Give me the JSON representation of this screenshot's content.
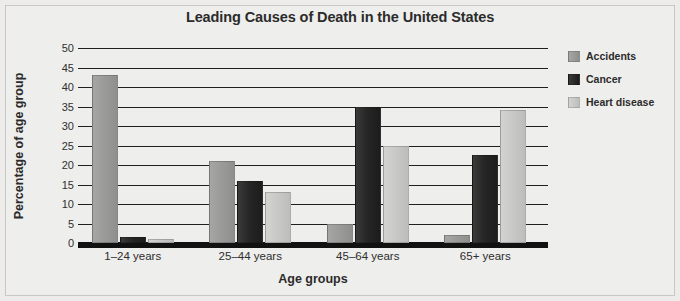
{
  "chart_data": {
    "type": "bar",
    "title": "Leading Causes of Death in the United States",
    "xlabel": "Age groups",
    "ylabel": "Percentage of age group",
    "categories": [
      "1–24 years",
      "25–44 years",
      "45–64 years",
      "65+ years"
    ],
    "series": [
      {
        "name": "Accidents",
        "color": "#9b9b99",
        "values": [
          43,
          21,
          5,
          2
        ]
      },
      {
        "name": "Cancer",
        "color": "#262626",
        "values": [
          1.5,
          16,
          35,
          22.5
        ]
      },
      {
        "name": "Heart disease",
        "color": "#c9c9c7",
        "values": [
          1,
          13,
          25,
          34
        ]
      }
    ],
    "ylim": [
      0,
      50
    ],
    "yticks": [
      50,
      45,
      40,
      35,
      30,
      25,
      20,
      15,
      10,
      5,
      0
    ],
    "ytick_labels": [
      "50",
      "45",
      "40",
      "35",
      "30",
      "25",
      "20",
      "15",
      "10",
      "5",
      "0"
    ],
    "grid": true,
    "legend_position": "right",
    "background_color": "#eeeeec",
    "axis_color": "#1f1f1f"
  },
  "legend": {
    "items": [
      {
        "label": "Accidents"
      },
      {
        "label": "Cancer"
      },
      {
        "label": "Heart disease"
      }
    ]
  }
}
